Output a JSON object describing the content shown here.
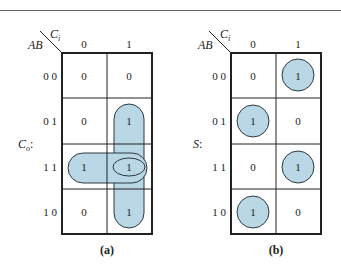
{
  "diagram": {
    "type": "karnaugh-maps",
    "colors": {
      "fill": "#b9d7e4",
      "stroke": "#2b3a44",
      "grid": "#222222"
    },
    "maps": [
      {
        "id": "a",
        "caption": "(a)",
        "function_label": "C",
        "function_sub": "o",
        "function_suffix": ":",
        "corner_row": "AB",
        "corner_col": "C",
        "corner_col_sub": "i",
        "col_headers": [
          "0",
          "1"
        ],
        "row_headers": [
          "0 0",
          "0 1",
          "1 1",
          "1 0"
        ],
        "cells": [
          [
            "0",
            "0"
          ],
          [
            "0",
            "1"
          ],
          [
            "1",
            "1"
          ],
          [
            "0",
            "1"
          ]
        ],
        "groups": [
          "column 1 rows 01-10 (vertical)",
          "row 11 (horizontal)",
          "cell 11/1 (ellipse)"
        ]
      },
      {
        "id": "b",
        "caption": "(b)",
        "function_label": "S",
        "function_sub": "",
        "function_suffix": ":",
        "corner_row": "AB",
        "corner_col": "C",
        "corner_col_sub": "i",
        "col_headers": [
          "0",
          "1"
        ],
        "row_headers": [
          "0 0",
          "0 1",
          "1 1",
          "1 0"
        ],
        "cells": [
          [
            "0",
            "1"
          ],
          [
            "1",
            "0"
          ],
          [
            "0",
            "1"
          ],
          [
            "1",
            "0"
          ]
        ],
        "groups": [
          "cell 00/1",
          "cell 01/0",
          "cell 11/1",
          "cell 10/0"
        ]
      }
    ]
  }
}
